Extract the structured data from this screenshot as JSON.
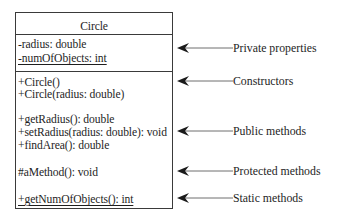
{
  "diagram": {
    "type": "uml-class",
    "class_name": "Circle",
    "properties": [
      {
        "text": "-radius: double",
        "static": false
      },
      {
        "text": "-numOfObjects: int",
        "static": true
      }
    ],
    "constructors": [
      {
        "text": "+Circle()"
      },
      {
        "text": "+Circle(radius: double)"
      }
    ],
    "public_methods": [
      {
        "text": "+getRadius(): double"
      },
      {
        "text": "+setRadius(radius: double): void"
      },
      {
        "text": "+findArea(): double"
      }
    ],
    "protected_methods": [
      {
        "text": "#aMethod(): void"
      }
    ],
    "static_methods": [
      {
        "text": "+getNumOfObjects(): int",
        "static": true
      }
    ],
    "annotations": [
      {
        "label": "Private properties",
        "points_to": "properties"
      },
      {
        "label": "Constructors",
        "points_to": "constructors"
      },
      {
        "label": "Public methods",
        "points_to": "public_methods"
      },
      {
        "label": "Protected methods",
        "points_to": "protected_methods"
      },
      {
        "label": "Static methods",
        "points_to": "static_methods"
      }
    ],
    "colors": {
      "line": "#3a3a3a",
      "arrow_line": "#6e6e6e",
      "arrowhead": "#1a1a1a",
      "text": "#1e1e1e"
    }
  }
}
